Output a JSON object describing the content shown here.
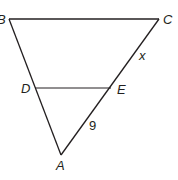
{
  "diagram": {
    "type": "triangle-with-parallel-segment",
    "stroke_color": "#231f20",
    "background": "#ffffff",
    "vertices": {
      "B": {
        "label": "B",
        "x": 9,
        "y": 19
      },
      "C": {
        "label": "C",
        "x": 159,
        "y": 19
      },
      "A": {
        "label": "A",
        "x": 61,
        "y": 155
      },
      "D": {
        "label": "D",
        "x": 35,
        "y": 88
      },
      "E": {
        "label": "E",
        "x": 111,
        "y": 88
      }
    },
    "segment_labels": {
      "EC": "x",
      "AE": "9"
    }
  }
}
